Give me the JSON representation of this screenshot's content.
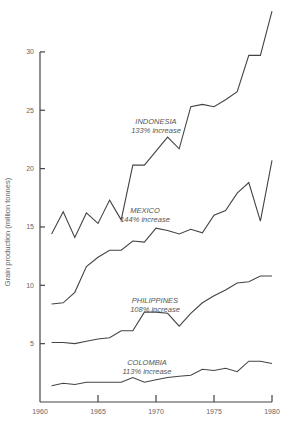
{
  "chart_data": {
    "type": "line",
    "title": "",
    "xlabel": "",
    "ylabel": "Grain production (million tonnes)",
    "xlim": [
      1960,
      1980
    ],
    "ylim": [
      0,
      30
    ],
    "x_ticks": [
      1960,
      1965,
      1970,
      1975,
      1980
    ],
    "y_ticks": [
      5,
      10,
      15,
      20,
      25,
      30
    ],
    "grid": false,
    "legend": "inline labels",
    "x": [
      1961,
      1962,
      1963,
      1964,
      1965,
      1966,
      1967,
      1968,
      1969,
      1970,
      1971,
      1972,
      1973,
      1974,
      1975,
      1976,
      1977,
      1978,
      1979,
      1980
    ],
    "series": [
      {
        "name": "INDONESIA",
        "note": "133% increase",
        "values": [
          14.4,
          16.3,
          14.1,
          16.2,
          15.3,
          17.3,
          15.6,
          20.3,
          20.3,
          21.5,
          22.7,
          21.7,
          25.3,
          25.5,
          25.3,
          25.9,
          26.6,
          29.7,
          29.7,
          33.5
        ],
        "label_pos": {
          "x": 156,
          "y": 124
        }
      },
      {
        "name": "MEXICO",
        "note": "144% increase",
        "values": [
          8.4,
          8.5,
          9.4,
          11.6,
          12.4,
          13.0,
          13.0,
          13.8,
          13.7,
          14.9,
          14.7,
          14.4,
          14.8,
          14.5,
          16.0,
          16.4,
          17.9,
          18.8,
          15.5,
          20.7
        ],
        "label_pos": {
          "x": 145,
          "y": 213
        }
      },
      {
        "name": "PHILIPPINES",
        "note": "108% increase",
        "values": [
          5.1,
          5.1,
          5.0,
          5.2,
          5.4,
          5.5,
          6.1,
          6.1,
          7.7,
          7.7,
          7.6,
          6.5,
          7.6,
          8.5,
          9.1,
          9.6,
          10.2,
          10.3,
          10.8,
          10.8
        ],
        "label_pos": {
          "x": 155,
          "y": 303
        }
      },
      {
        "name": "COLOMBIA",
        "note": "113% increase",
        "values": [
          1.4,
          1.6,
          1.5,
          1.7,
          1.7,
          1.7,
          1.7,
          2.1,
          1.7,
          1.9,
          2.1,
          2.2,
          2.3,
          2.8,
          2.7,
          2.9,
          2.6,
          3.5,
          3.5,
          3.3
        ],
        "label_pos": {
          "x": 147,
          "y": 365
        }
      }
    ]
  },
  "axes": {
    "y_label": "Grain production (million tonnes)",
    "x_tick_labels": [
      "1960",
      "1965",
      "1970",
      "1975",
      "1980"
    ],
    "y_tick_labels": [
      "5",
      "10",
      "15",
      "20",
      "25",
      "30"
    ]
  }
}
